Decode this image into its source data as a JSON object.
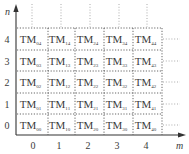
{
  "diagram": {
    "axes": {
      "x_label": "m",
      "y_label": "n",
      "x_ticks": [
        "0",
        "1",
        "2",
        "3",
        "4"
      ],
      "y_ticks": [
        "0",
        "1",
        "2",
        "3",
        "4"
      ]
    },
    "cell_prefix": "TM",
    "grid": {
      "rows": [
        {
          "n": "4",
          "cells": [
            "04",
            "14",
            "24",
            "34",
            "44"
          ]
        },
        {
          "n": "3",
          "cells": [
            "03",
            "13",
            "23",
            "33",
            "43"
          ]
        },
        {
          "n": "2",
          "cells": [
            "02",
            "12",
            "22",
            "32",
            "42"
          ]
        },
        {
          "n": "1",
          "cells": [
            "01",
            "11",
            "21",
            "31",
            "41"
          ]
        },
        {
          "n": "0",
          "cells": [
            "00",
            "10",
            "20",
            "30",
            "40"
          ]
        }
      ]
    },
    "colors": {
      "text": "#3a3a3a",
      "axis": "#333333",
      "grid": "#555555",
      "background": "#ffffff"
    }
  }
}
